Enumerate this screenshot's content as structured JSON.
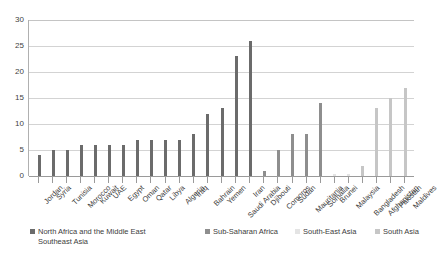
{
  "chart_data": {
    "type": "bar",
    "title": "",
    "subtitle": "",
    "xlabel": "",
    "ylabel": "",
    "ylim": [
      0,
      30
    ],
    "yticks": [
      0,
      5,
      10,
      15,
      20,
      25,
      30
    ],
    "grid": true,
    "legend_position": "bottom",
    "categories": [
      "Jordan",
      "Syria",
      "Tunisia",
      "Morocco",
      "Kuwait",
      "UAE",
      "Egypt",
      "Oman",
      "Qatar",
      "Libya",
      "Algeria",
      "Iraq",
      "Bahrain",
      "Yemen",
      "Saudi Arabia",
      "Iran",
      "Djibouti",
      "Comoros",
      "Sudan",
      "Mauritania",
      "Somalia",
      "Brunei",
      "Malaysia",
      "Bangladesh",
      "Afghanistan",
      "Pakistan",
      "Maldives"
    ],
    "values": [
      4,
      5,
      5,
      6,
      6,
      6,
      6,
      7,
      7,
      7,
      7,
      8,
      12,
      13,
      23,
      26,
      1,
      5,
      8,
      8,
      14,
      0.4,
      0.4,
      2,
      13,
      15,
      17
    ],
    "bar_groups": [
      "mena",
      "mena",
      "mena",
      "mena",
      "mena",
      "mena",
      "mena",
      "mena",
      "mena",
      "mena",
      "mena",
      "mena",
      "mena",
      "mena",
      "mena",
      "mena",
      "ssa",
      "ssa",
      "ssa",
      "ssa",
      "ssa",
      "sea",
      "sea",
      "sa",
      "sa",
      "sa",
      "sa"
    ],
    "legend": [
      {
        "key": "mena",
        "label": "North Africa and the Middle East\nSoutheast Asia",
        "color": "#6b6b6b"
      },
      {
        "key": "ssa",
        "label": "Sub-Saharan Africa",
        "color": "#8e8e8e"
      },
      {
        "key": "sea",
        "label": "South-East Asia",
        "color": "#e4e4e4"
      },
      {
        "key": "sa",
        "label": "South Asia",
        "color": "#c6c6c6"
      }
    ]
  }
}
